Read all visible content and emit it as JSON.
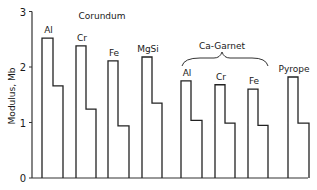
{
  "chart_data": {
    "type": "bar",
    "title": "",
    "xlabel": "",
    "ylabel": "Modulus, Mb",
    "ylim": [
      0,
      3
    ],
    "yticks": [
      0,
      1,
      2,
      3
    ],
    "grid": false,
    "legend": null,
    "groups": [
      {
        "name": "Corundum",
        "annotation": "Corundum",
        "members": [
          "Al",
          "Cr",
          "Fe",
          "MgSi"
        ]
      },
      {
        "name": "Ca-Garnet",
        "annotation": "Ca-Garnet",
        "bracket": true,
        "members": [
          "Al",
          "Cr",
          "Fe"
        ]
      },
      {
        "name": "Pyrope",
        "members": [
          "Pyrope"
        ]
      }
    ],
    "categories": [
      "Al",
      "Cr",
      "Fe",
      "MgSi",
      "Al",
      "Cr",
      "Fe",
      "Pyrope"
    ],
    "series": [
      {
        "name": "Bulk modulus (tall step)",
        "values": [
          2.52,
          2.38,
          2.11,
          2.18,
          1.75,
          1.68,
          1.6,
          1.82
        ]
      },
      {
        "name": "Shear modulus (short step)",
        "values": [
          1.66,
          1.24,
          0.94,
          1.35,
          1.04,
          0.99,
          0.95,
          0.99
        ]
      }
    ]
  },
  "labels": {
    "ylabel": "Modulus, Mb",
    "corundum": "Corundum",
    "ca_garnet": "Ca-Garnet"
  }
}
